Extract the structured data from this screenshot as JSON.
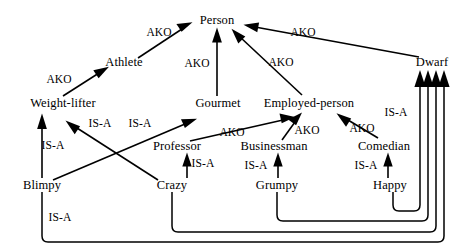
{
  "diagram": {
    "width": 469,
    "height": 252,
    "background": "#ffffff",
    "ink": "#000000"
  },
  "nodes": [
    {
      "id": "person",
      "label": "Person",
      "x": 217,
      "y": 20
    },
    {
      "id": "athlete",
      "label": "Athlete",
      "x": 124,
      "y": 62
    },
    {
      "id": "dwarf",
      "label": "Dwarf",
      "x": 432,
      "y": 62
    },
    {
      "id": "weight_lifter",
      "label": "Weight-lifter",
      "x": 63,
      "y": 103
    },
    {
      "id": "gourmet",
      "label": "Gourmet",
      "x": 218,
      "y": 103
    },
    {
      "id": "employed_person",
      "label": "Employed-person",
      "x": 309,
      "y": 103
    },
    {
      "id": "professor",
      "label": "Professor",
      "x": 177,
      "y": 146
    },
    {
      "id": "businessman",
      "label": "Businessman",
      "x": 274,
      "y": 146
    },
    {
      "id": "comedian",
      "label": "Comedian",
      "x": 384,
      "y": 146
    },
    {
      "id": "blimpy",
      "label": "Blimpy",
      "x": 42,
      "y": 185
    },
    {
      "id": "crazy",
      "label": "Crazy",
      "x": 172,
      "y": 185
    },
    {
      "id": "grumpy",
      "label": "Grumpy",
      "x": 277,
      "y": 185
    },
    {
      "id": "happy",
      "label": "Happy",
      "x": 390,
      "y": 185
    }
  ],
  "edges": [
    {
      "id": "e1",
      "from": "athlete",
      "to": "person",
      "relation": "AKO",
      "label_x": 159,
      "label_y": 33
    },
    {
      "id": "e2",
      "from": "gourmet",
      "to": "person",
      "relation": "AKO",
      "label_x": 197,
      "label_y": 64
    },
    {
      "id": "e3",
      "from": "employed_person",
      "to": "person",
      "relation": "AKO",
      "label_x": 281,
      "label_y": 63
    },
    {
      "id": "e4",
      "from": "dwarf",
      "to": "person",
      "relation": "AKO",
      "label_x": 303,
      "label_y": 33
    },
    {
      "id": "e5",
      "from": "weight_lifter",
      "to": "athlete",
      "relation": "AKO",
      "label_x": 59,
      "label_y": 80
    },
    {
      "id": "e6",
      "from": "blimpy",
      "to": "weight_lifter",
      "relation": "IS-A",
      "label_x": 53,
      "label_y": 146
    },
    {
      "id": "e7",
      "from": "crazy",
      "to": "weight_lifter",
      "relation": "IS-A",
      "label_x": 100,
      "label_y": 124
    },
    {
      "id": "e8",
      "from": "blimpy",
      "to": "gourmet",
      "relation": "IS-A",
      "label_x": 140,
      "label_y": 124
    },
    {
      "id": "e9",
      "from": "professor",
      "to": "employed_person",
      "relation": "AKO",
      "label_x": 232,
      "label_y": 133
    },
    {
      "id": "e10",
      "from": "businessman",
      "to": "employed_person",
      "relation": "AKO",
      "label_x": 307,
      "label_y": 131
    },
    {
      "id": "e11",
      "from": "comedian",
      "to": "employed_person",
      "relation": "AKO",
      "label_x": 362,
      "label_y": 129
    },
    {
      "id": "e12",
      "from": "crazy",
      "to": "professor",
      "relation": "IS-A",
      "label_x": 203,
      "label_y": 164
    },
    {
      "id": "e13",
      "from": "grumpy",
      "to": "businessman",
      "relation": "IS-A",
      "label_x": 256,
      "label_y": 166
    },
    {
      "id": "e14",
      "from": "happy",
      "to": "comedian",
      "relation": "IS-A",
      "label_x": 366,
      "label_y": 166
    },
    {
      "id": "e15",
      "from": "happy",
      "to": "dwarf",
      "relation": "IS-A",
      "label_x": 396,
      "label_y": 113
    },
    {
      "id": "e16",
      "from": "grumpy",
      "to": "dwarf",
      "relation": "",
      "label_x": 0,
      "label_y": 0
    },
    {
      "id": "e17",
      "from": "crazy",
      "to": "dwarf",
      "relation": "",
      "label_x": 0,
      "label_y": 0
    },
    {
      "id": "e18",
      "from": "blimpy",
      "to": "dwarf",
      "relation": "IS-A",
      "label_x": 60,
      "label_y": 218
    }
  ],
  "relations": {
    "ako": "AKO",
    "isa": "IS-A"
  }
}
